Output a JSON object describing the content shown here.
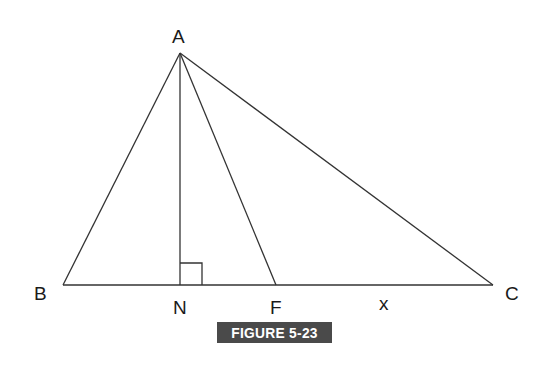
{
  "figure": {
    "caption": "FIGURE 5-23",
    "caption_bg_color": "#4a4a4a",
    "caption_text_color": "#ffffff",
    "line_color": "#333333"
  },
  "points": {
    "A": {
      "label": "A",
      "x": 180,
      "y": 53
    },
    "B": {
      "label": "B",
      "x": 63,
      "y": 285
    },
    "C": {
      "label": "C",
      "x": 493,
      "y": 285
    },
    "N": {
      "label": "N",
      "x": 180,
      "y": 285
    },
    "F": {
      "label": "F",
      "x": 276,
      "y": 285
    }
  },
  "segments": [
    "AB",
    "AC",
    "BC",
    "AN",
    "AF"
  ],
  "annotations": {
    "right_angle_at": "N",
    "segment_FC_label": "x"
  }
}
